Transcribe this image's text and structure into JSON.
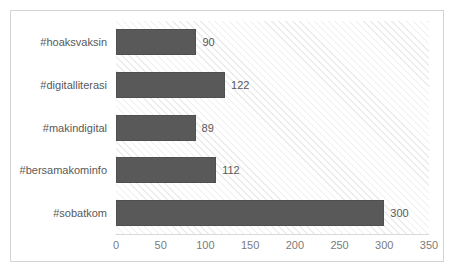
{
  "chart_data": {
    "type": "bar",
    "orientation": "horizontal",
    "title": "",
    "subtitle": "",
    "xlabel": "",
    "ylabel": "",
    "categories": [
      "#hoaksvaksin",
      "#digitalliterasi",
      "#makindigital",
      "#bersamakominfo",
      "#sobatkom"
    ],
    "values": [
      90,
      122,
      89,
      112,
      300
    ],
    "value_labels": [
      "90",
      "122",
      "89",
      "112",
      "300"
    ],
    "xlim": [
      0,
      350
    ],
    "ylim": [
      0,
      5
    ],
    "xticks": [
      0,
      50,
      100,
      150,
      200,
      250,
      300,
      350
    ],
    "xtick_labels": [
      "0",
      "50",
      "100",
      "150",
      "200",
      "250",
      "300",
      "350"
    ],
    "grid": false,
    "legend": false,
    "legend_position": "none",
    "series": [
      {
        "name": "Jumlah",
        "values": [
          90,
          122,
          89,
          112,
          300
        ]
      }
    ],
    "colors": {
      "bar_fill": "#595959",
      "bar_edge": "#4f4f4f",
      "plot_background": "#ffffff",
      "plot_hatch": "#ececec",
      "frame_border": "#d4d4d4",
      "axis_line": "#d9d9d9",
      "category_label_text": "#595959",
      "value_label_text": "#595959",
      "tick_label_text": "#7b7b7b"
    }
  }
}
